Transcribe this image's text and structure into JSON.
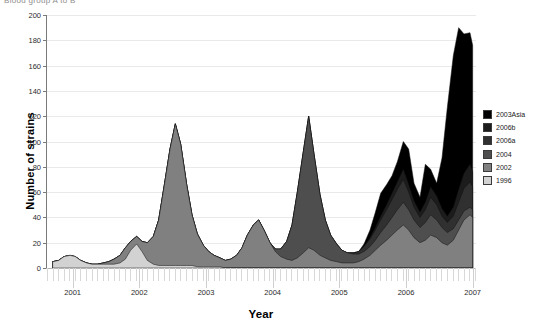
{
  "figure": {
    "cut_off_header": "Blood group A to B",
    "xtitle": "Year",
    "ytitle": "Number of strains"
  },
  "legend": {
    "items": [
      {
        "label": "2003Asia",
        "color": "#000000"
      },
      {
        "label": "2006b",
        "color": "#1c1c1c"
      },
      {
        "label": "2006a",
        "color": "#303030"
      },
      {
        "label": "2004",
        "color": "#4e4e4e"
      },
      {
        "label": "2002",
        "color": "#808080"
      },
      {
        "label": "1996",
        "color": "#d2d2d2"
      }
    ]
  },
  "chart_data": {
    "type": "area",
    "title": "",
    "subtitle": "",
    "xlabel": "Year",
    "ylabel": "Number of strains",
    "stacked": true,
    "grid": true,
    "legend_position": "right",
    "xlim": [
      2000.6,
      2007.05
    ],
    "ylim": [
      0,
      200
    ],
    "yticks": [
      0,
      20,
      40,
      60,
      80,
      100,
      120,
      140,
      160,
      180,
      200
    ],
    "xticks": [
      2001,
      2002,
      2003,
      2004,
      2005,
      2006,
      2007
    ],
    "minor_tick_interval": 0.0833,
    "x": [
      2000.7,
      2000.79,
      2000.87,
      2000.96,
      2001.04,
      2001.12,
      2001.21,
      2001.29,
      2001.37,
      2001.46,
      2001.54,
      2001.62,
      2001.71,
      2001.79,
      2001.87,
      2001.96,
      2002.04,
      2002.12,
      2002.21,
      2002.29,
      2002.37,
      2002.46,
      2002.54,
      2002.62,
      2002.71,
      2002.79,
      2002.87,
      2002.96,
      2003.04,
      2003.12,
      2003.21,
      2003.29,
      2003.37,
      2003.46,
      2003.54,
      2003.62,
      2003.71,
      2003.79,
      2003.87,
      2003.96,
      2004.04,
      2004.12,
      2004.21,
      2004.29,
      2004.37,
      2004.46,
      2004.54,
      2004.62,
      2004.71,
      2004.79,
      2004.87,
      2004.96,
      2005.04,
      2005.12,
      2005.21,
      2005.29,
      2005.37,
      2005.46,
      2005.54,
      2005.62,
      2005.71,
      2005.79,
      2005.87,
      2005.96,
      2006.04,
      2006.12,
      2006.21,
      2006.29,
      2006.37,
      2006.46,
      2006.54,
      2006.62,
      2006.71,
      2006.79,
      2006.87,
      2006.96,
      2007.0
    ],
    "series": [
      {
        "name": "1996",
        "color": "#d2d2d2",
        "values": [
          5,
          6,
          9,
          10,
          9,
          6,
          4,
          3,
          3,
          3,
          3,
          3,
          4,
          7,
          14,
          19,
          13,
          6,
          3,
          2,
          2,
          2,
          2,
          2,
          2,
          2,
          1,
          1,
          1,
          1,
          1,
          0,
          0,
          0,
          0,
          0,
          0,
          0,
          0,
          0,
          0,
          0,
          0,
          0,
          0,
          0,
          0,
          0,
          0,
          0,
          0,
          0,
          0,
          0,
          0,
          0,
          0,
          0,
          0,
          0,
          0,
          0,
          0,
          0,
          0,
          0,
          0,
          0,
          0,
          0,
          0,
          0,
          0,
          0,
          0,
          0,
          0
        ]
      },
      {
        "name": "2002",
        "color": "#808080",
        "values": [
          0,
          0,
          0,
          0,
          0,
          0,
          0,
          0,
          0,
          1,
          2,
          4,
          6,
          9,
          7,
          6,
          8,
          14,
          22,
          36,
          62,
          92,
          112,
          96,
          64,
          40,
          26,
          17,
          12,
          9,
          7,
          6,
          7,
          10,
          16,
          26,
          34,
          38,
          30,
          20,
          13,
          9,
          7,
          6,
          8,
          12,
          16,
          14,
          10,
          8,
          6,
          5,
          4,
          4,
          4,
          5,
          7,
          10,
          14,
          18,
          22,
          26,
          30,
          34,
          30,
          24,
          20,
          22,
          26,
          24,
          20,
          18,
          22,
          30,
          38,
          42,
          40
        ]
      },
      {
        "name": "2004",
        "color": "#4e4e4e",
        "values": [
          0,
          0,
          0,
          0,
          0,
          0,
          0,
          0,
          0,
          0,
          0,
          0,
          0,
          0,
          0,
          0,
          0,
          0,
          0,
          0,
          0,
          0,
          0,
          0,
          0,
          0,
          0,
          0,
          0,
          0,
          0,
          0,
          0,
          0,
          0,
          0,
          0,
          0,
          0,
          0,
          2,
          6,
          14,
          28,
          52,
          80,
          104,
          76,
          48,
          30,
          20,
          14,
          10,
          8,
          7,
          6,
          6,
          7,
          8,
          10,
          12,
          14,
          16,
          18,
          16,
          14,
          12,
          14,
          16,
          14,
          12,
          10,
          9,
          8,
          7,
          6,
          6
        ]
      },
      {
        "name": "2006a",
        "color": "#303030",
        "values": [
          0,
          0,
          0,
          0,
          0,
          0,
          0,
          0,
          0,
          0,
          0,
          0,
          0,
          0,
          0,
          0,
          0,
          0,
          0,
          0,
          0,
          0,
          0,
          0,
          0,
          0,
          0,
          0,
          0,
          0,
          0,
          0,
          0,
          0,
          0,
          0,
          0,
          0,
          0,
          0,
          0,
          0,
          0,
          0,
          0,
          0,
          0,
          0,
          0,
          0,
          0,
          0,
          0,
          0,
          1,
          2,
          4,
          6,
          8,
          10,
          12,
          14,
          16,
          18,
          14,
          10,
          8,
          10,
          14,
          12,
          9,
          8,
          10,
          14,
          18,
          20,
          18
        ]
      },
      {
        "name": "2006b",
        "color": "#1c1c1c",
        "values": [
          0,
          0,
          0,
          0,
          0,
          0,
          0,
          0,
          0,
          0,
          0,
          0,
          0,
          0,
          0,
          0,
          0,
          0,
          0,
          0,
          0,
          0,
          0,
          0,
          0,
          0,
          0,
          0,
          0,
          0,
          0,
          0,
          0,
          0,
          0,
          0,
          0,
          0,
          0,
          0,
          0,
          0,
          0,
          0,
          0,
          0,
          0,
          0,
          0,
          0,
          0,
          0,
          0,
          0,
          0,
          0,
          0,
          1,
          2,
          3,
          4,
          5,
          6,
          8,
          6,
          5,
          4,
          6,
          8,
          7,
          6,
          5,
          7,
          10,
          12,
          14,
          12
        ]
      },
      {
        "name": "2003Asia",
        "color": "#000000",
        "values": [
          0,
          0,
          0,
          0,
          0,
          0,
          0,
          0,
          0,
          0,
          0,
          0,
          0,
          0,
          0,
          0,
          0,
          0,
          0,
          0,
          0,
          0,
          0,
          0,
          0,
          0,
          0,
          0,
          0,
          0,
          0,
          0,
          0,
          0,
          0,
          0,
          0,
          0,
          0,
          0,
          0,
          0,
          0,
          0,
          0,
          0,
          0,
          0,
          0,
          0,
          0,
          0,
          0,
          0,
          0,
          0,
          2,
          6,
          12,
          18,
          16,
          14,
          16,
          22,
          28,
          14,
          12,
          30,
          14,
          10,
          40,
          86,
          120,
          128,
          110,
          104,
          100
        ]
      }
    ],
    "annotations": [
      {
        "text": "peak 2002 strain wave",
        "x": 2002.54,
        "y": 113
      },
      {
        "text": "peak 2004 strain wave",
        "x": 2004.54,
        "y": 122
      },
      {
        "text": "peak 2003Asia wave",
        "x": 2006.79,
        "y": 181
      }
    ]
  }
}
